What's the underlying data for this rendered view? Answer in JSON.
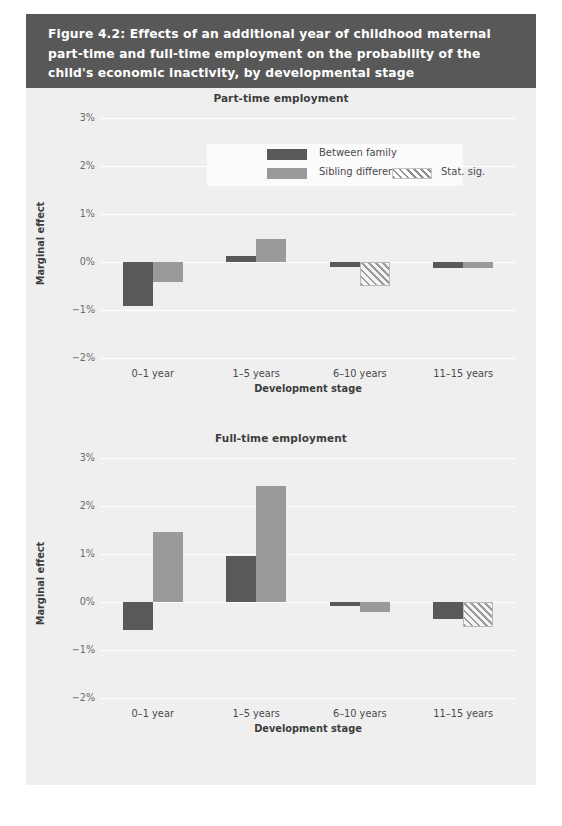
{
  "figure": {
    "caption": "Figure 4.2: Effects of an additional year of childhood maternal part-time and full-time employment on the probability of the child's economic inactivity, by developmental stage",
    "header_color": "#585858",
    "panel_color": "#efefef"
  },
  "legend": {
    "items": [
      {
        "label": "Between family",
        "swatch": "dark",
        "color": "#595959"
      },
      {
        "label": "Sibling difference",
        "swatch": "light",
        "color": "#9a9a9a"
      },
      {
        "label": "Stat. sig.",
        "swatch": "hatch",
        "color": "#9a9a9a"
      }
    ]
  },
  "chart_data": [
    {
      "type": "bar",
      "title": "Part-time employment",
      "xlabel": "Development stage",
      "ylabel": "Marginal effect",
      "categories": [
        "0–1 year",
        "1–5 years",
        "6–10 years",
        "11–15 years"
      ],
      "yticks": [
        "3%",
        "2%",
        "1%",
        "0%",
        "−1%",
        "−2%"
      ],
      "ytick_values": [
        3,
        2,
        1,
        0,
        -1,
        -2
      ],
      "ylim": [
        -2,
        3
      ],
      "grid": true,
      "legend_position": "top-right-inside",
      "series": [
        {
          "name": "Between family",
          "values": [
            -0.92,
            0.12,
            -0.1,
            -0.13
          ],
          "significant": [
            false,
            false,
            false,
            false
          ]
        },
        {
          "name": "Sibling difference",
          "values": [
            -0.42,
            0.47,
            -0.5,
            -0.13
          ],
          "significant": [
            false,
            false,
            true,
            false
          ]
        }
      ]
    },
    {
      "type": "bar",
      "title": "Full-time employment",
      "xlabel": "Development stage",
      "ylabel": "Marginal effect",
      "categories": [
        "0–1 year",
        "1–5 years",
        "6–10 years",
        "11–15 years"
      ],
      "yticks": [
        "3%",
        "2%",
        "1%",
        "0%",
        "−1%",
        "−2%"
      ],
      "ytick_values": [
        3,
        2,
        1,
        0,
        -1,
        -2
      ],
      "ylim": [
        -2,
        3
      ],
      "grid": true,
      "legend_position": "none",
      "series": [
        {
          "name": "Between family",
          "values": [
            -0.58,
            0.95,
            -0.08,
            -0.36
          ],
          "significant": [
            false,
            false,
            false,
            false
          ]
        },
        {
          "name": "Sibling difference",
          "values": [
            1.45,
            2.42,
            -0.2,
            -0.52
          ],
          "significant": [
            false,
            false,
            false,
            true
          ]
        }
      ]
    }
  ]
}
